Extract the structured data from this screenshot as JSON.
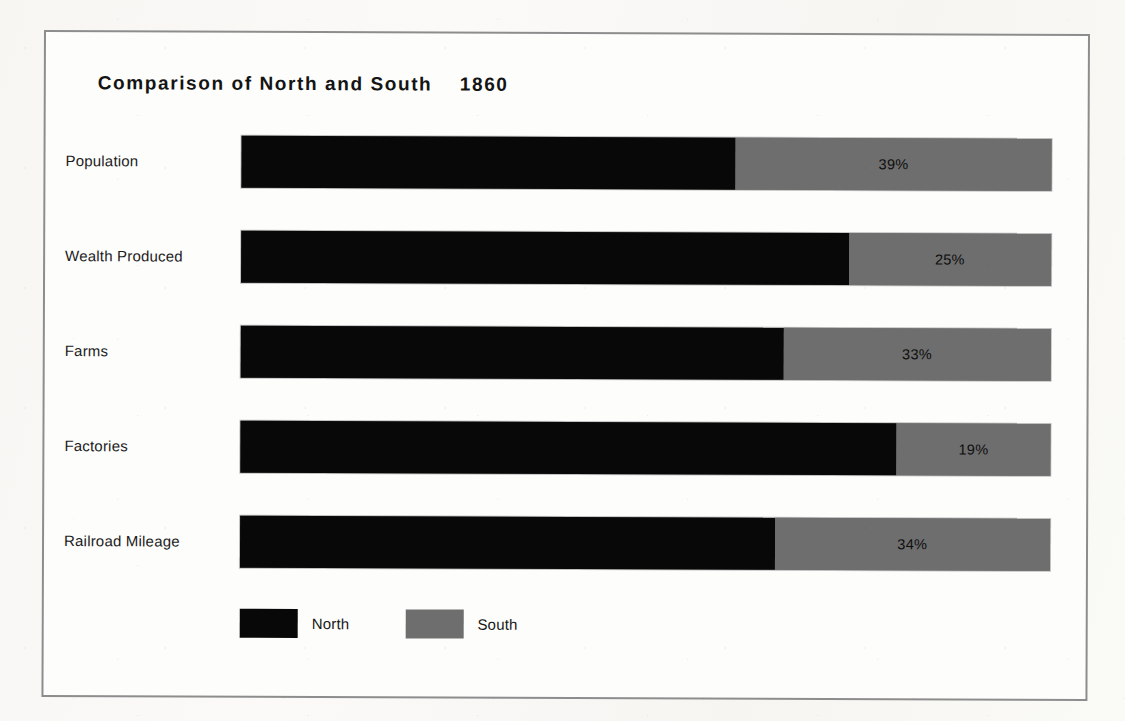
{
  "figure": {
    "title": "Comparison of North and South    1860",
    "border_color": "#8d8d8d",
    "background_color": "#fdfdfb"
  },
  "legend": {
    "items": [
      {
        "label": "North",
        "color": "#080808",
        "swatch_name": "legend-swatch-north"
      },
      {
        "label": "South",
        "color": "#6e6e6e",
        "swatch_name": "legend-swatch-south"
      }
    ]
  },
  "rows": [
    {
      "label": "Population",
      "north": 61,
      "south": 39,
      "south_label": "39%"
    },
    {
      "label": "Wealth Produced",
      "north": 75,
      "south": 25,
      "south_label": "25%"
    },
    {
      "label": "Farms",
      "north": 67,
      "south": 33,
      "south_label": "33%"
    },
    {
      "label": "Factories",
      "north": 81,
      "south": 19,
      "south_label": "19%"
    },
    {
      "label": "Railroad Mileage",
      "north": 66,
      "south": 34,
      "south_label": "34%"
    }
  ],
  "chart_data": {
    "type": "bar",
    "subtype": "horizontal-100-percent-stacked",
    "title": "Comparison of North and South    1860",
    "subtitle": "",
    "xlabel": "",
    "ylabel": "",
    "xlim": [
      0,
      100
    ],
    "grid": false,
    "legend_position": "bottom-left",
    "categories": [
      "Population",
      "Wealth Produced",
      "Farms",
      "Factories",
      "Railroad Mileage"
    ],
    "series": [
      {
        "name": "North",
        "color": "#080808",
        "values": [
          61,
          75,
          67,
          81,
          66
        ]
      },
      {
        "name": "South",
        "color": "#6e6e6e",
        "values": [
          39,
          25,
          33,
          19,
          34
        ]
      }
    ],
    "data_labels": {
      "North": [
        "",
        "",
        "",
        "",
        ""
      ],
      "South": [
        "39%",
        "25%",
        "33%",
        "19%",
        "34%"
      ]
    },
    "units": "percent"
  }
}
